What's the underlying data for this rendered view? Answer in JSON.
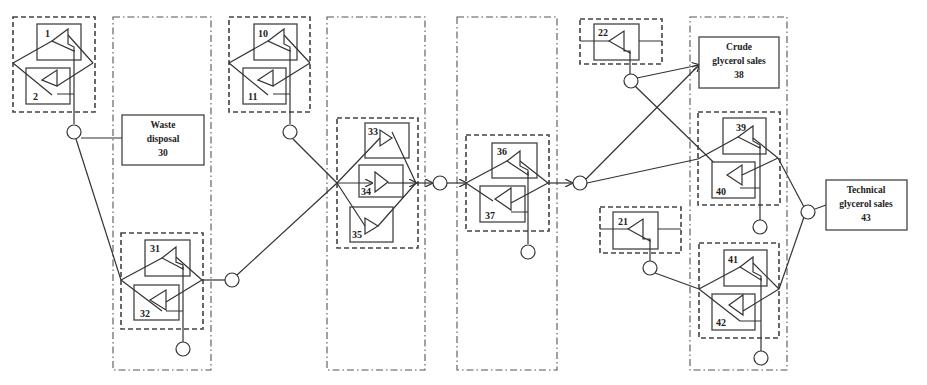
{
  "caption_fragment": "...glycerol ... glycerol ... glycerol...",
  "units": {
    "u1": "1",
    "u2": "2",
    "u10": "10",
    "u11": "11",
    "u21": "21",
    "u22": "22",
    "u31": "31",
    "u32": "32",
    "u33": "33",
    "u34": "34",
    "u35": "35",
    "u36": "36",
    "u37": "37",
    "u39": "39",
    "u40": "40",
    "u41": "41",
    "u42": "42"
  },
  "sinks": {
    "waste": {
      "line1": "Waste",
      "line2": "disposal",
      "id": "30"
    },
    "crude": {
      "line1": "Crude",
      "line2": "glycerol sales",
      "id": "38"
    },
    "technical": {
      "line1": "Technical",
      "line2": "glycerol sales",
      "id": "43"
    }
  },
  "colors": {
    "line": "#333333",
    "background": "#ffffff"
  }
}
